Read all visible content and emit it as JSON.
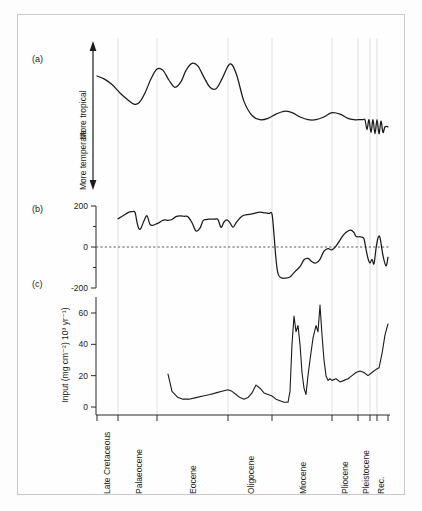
{
  "figure": {
    "background_color": "#fdfdfd",
    "frame_color": "#c9c9c9",
    "curve_color": "#1b1b1b",
    "grid_color": "#e2e2e2"
  },
  "panels": {
    "a": {
      "tag": "(a)"
    },
    "b": {
      "tag": "(b)"
    },
    "c": {
      "tag": "(c)"
    }
  },
  "axis_arrow": {
    "top_label": "More tropical",
    "bottom_label": "More temperate"
  },
  "panel_b_axis": {
    "ticks": [
      "200",
      "0",
      "-200"
    ],
    "tick_values": [
      200,
      0,
      -200
    ]
  },
  "panel_c_axis": {
    "title": "Input (mg cm⁻²) 10³ yr⁻¹)",
    "ticks": [
      "60",
      "40",
      "20",
      "0"
    ],
    "tick_values": [
      60,
      40,
      20,
      0
    ]
  },
  "epochs": [
    {
      "label": "Late Cretaceous",
      "x": 107
    },
    {
      "label": "Palaeocene",
      "x": 139
    },
    {
      "label": "Eocene",
      "x": 193
    },
    {
      "label": "Oligocene",
      "x": 251
    },
    {
      "label": "Miocene",
      "x": 303
    },
    {
      "label": "Pliocene",
      "x": 345
    },
    {
      "label": "Pleistocene",
      "x": 366
    },
    {
      "label": "Rec.",
      "x": 381
    }
  ],
  "gridlines_x": [
    118,
    157,
    228,
    272,
    332,
    358,
    370,
    377
  ],
  "xtick_positions": [
    97,
    118,
    157,
    228,
    272,
    332,
    358,
    370,
    377,
    388
  ],
  "chart_data": {
    "type": "line",
    "title": "",
    "xlabel": "Geological epoch",
    "layout": {
      "plot_left": 97,
      "plot_right": 388,
      "grid": true,
      "legend_position": "none",
      "stacked_panels": 3
    },
    "panels": [
      {
        "id": "a",
        "tag": "(a)",
        "ylabel": "Climate (More temperate ↔ More tropical)",
        "ylim": [
          0,
          100
        ],
        "axis_ticks_shown": false,
        "description": "Relative climate curve; warm/tropical early Palaeogene, cooling after Eocene, high-frequency glacial oscillations in Pleistocene",
        "x": [
          97,
          104,
          112,
          120,
          128,
          134,
          139,
          145,
          151,
          157,
          163,
          169,
          175,
          181,
          186,
          192,
          198,
          204,
          210,
          216,
          222,
          228,
          232,
          237,
          244,
          252,
          260,
          268,
          276,
          284,
          292,
          300,
          308,
          316,
          324,
          332,
          340,
          348,
          354,
          358,
          361,
          363,
          365,
          367,
          369,
          371,
          373,
          375,
          377,
          379,
          381,
          383,
          385,
          388
        ],
        "y": [
          78,
          76,
          72,
          66,
          61,
          58,
          59,
          66,
          76,
          83,
          82,
          75,
          70,
          74,
          82,
          87,
          85,
          77,
          70,
          69,
          76,
          85,
          86,
          78,
          60,
          50,
          47,
          48,
          51,
          53,
          52,
          49,
          47,
          47,
          49,
          52,
          51,
          48,
          47,
          47,
          47,
          47,
          47,
          40,
          47,
          38,
          47,
          37,
          47,
          37,
          46,
          38,
          42,
          42
        ]
      },
      {
        "id": "b",
        "tag": "(b)",
        "ylabel": "",
        "ylim": [
          -260,
          240
        ],
        "unit": "",
        "description": "Sustained positive values (~120-175) through Cretaceous to Eocene with sharp negative spikes; abrupt collapse to about -150 at the Eocene/Oligocene boundary, then oscillation around zero",
        "x": [
          118,
          123,
          128,
          132,
          135,
          137,
          139,
          141,
          144,
          147,
          150,
          153,
          156,
          159,
          162,
          165,
          168,
          172,
          176,
          180,
          184,
          188,
          192,
          196,
          200,
          203,
          206,
          209,
          212,
          215,
          218,
          221,
          224,
          227,
          230,
          233,
          236,
          239,
          242,
          245,
          248,
          251,
          254,
          257,
          260,
          263,
          266,
          269,
          272,
          274,
          276,
          278,
          281,
          285,
          290,
          295,
          300,
          304,
          308,
          312,
          316,
          320,
          324,
          328,
          332,
          336,
          340,
          344,
          348,
          351,
          354,
          356,
          358,
          360,
          362,
          364,
          366,
          368,
          370,
          372,
          374,
          376,
          378,
          380,
          383,
          386,
          388
        ],
        "y": [
          138,
          152,
          168,
          172,
          170,
          120,
          88,
          92,
          128,
          152,
          110,
          106,
          112,
          118,
          128,
          132,
          130,
          134,
          148,
          152,
          150,
          148,
          118,
          78,
          92,
          128,
          134,
          136,
          136,
          136,
          134,
          96,
          122,
          132,
          118,
          96,
          118,
          136,
          150,
          156,
          158,
          160,
          164,
          168,
          170,
          168,
          166,
          164,
          160,
          60,
          -60,
          -130,
          -150,
          -152,
          -146,
          -120,
          -96,
          -62,
          -56,
          -72,
          -78,
          -60,
          -20,
          -8,
          -14,
          4,
          34,
          62,
          78,
          82,
          70,
          52,
          50,
          50,
          48,
          40,
          -10,
          -56,
          -78,
          -60,
          -82,
          -8,
          44,
          46,
          -42,
          -92,
          -50
        ]
      },
      {
        "id": "c",
        "tag": "(c)",
        "ylabel": "Input (mg cm⁻²) 10³ yr⁻¹)",
        "ylim": [
          -4,
          72
        ],
        "unit": "mg cm^-2 10^3 yr^-1",
        "description": "Sediment input record; low (~5-11) through Palaeogene, two large Miocene spikes (~58 and ~65), then a step up to ~17-25 and a final rise to ~53",
        "x": [
          168,
          172,
          178,
          183,
          189,
          196,
          203,
          210,
          216,
          222,
          228,
          232,
          236,
          240,
          244,
          248,
          252,
          256,
          260,
          264,
          268,
          272,
          276,
          280,
          284,
          288,
          290,
          292,
          294,
          296,
          298,
          300,
          302,
          304,
          306,
          308,
          310,
          313,
          316,
          318,
          320,
          322,
          324,
          326,
          328,
          330,
          332,
          336,
          340,
          344,
          348,
          352,
          356,
          360,
          364,
          368,
          372,
          376,
          379,
          382,
          385,
          388
        ],
        "y": [
          21,
          10,
          6,
          5,
          5,
          6,
          7,
          8,
          9,
          10,
          11,
          10,
          8,
          6,
          5,
          6,
          9,
          14,
          12,
          9,
          8,
          7,
          5,
          4,
          3,
          3,
          10,
          40,
          58,
          48,
          52,
          40,
          22,
          12,
          8,
          20,
          30,
          44,
          52,
          48,
          65,
          46,
          30,
          20,
          17,
          18,
          17,
          18,
          16,
          17,
          18,
          20,
          22,
          23,
          22,
          20,
          22,
          24,
          25,
          34,
          46,
          53
        ]
      }
    ]
  }
}
